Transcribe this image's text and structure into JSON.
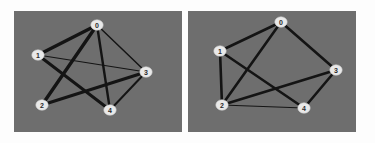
{
  "figure": {
    "background_color": "#fdfdfd",
    "panel_color": "#6e6e6e",
    "edge_color": "#141414",
    "node_fill_color": "#e9e9e9",
    "node_label_color": "#2b2b2b",
    "width": 375,
    "height": 143
  },
  "chart_data": {
    "type": "diagram",
    "subtype": "node-link-graph-pair",
    "title": "",
    "xlabel": "",
    "ylabel": "",
    "grid": false,
    "legend": null,
    "panels": [
      {
        "id": "panel-left",
        "name": "left-graph",
        "node_labels": [
          "0",
          "1",
          "2",
          "3",
          "4"
        ],
        "nodes": [
          {
            "id": "0",
            "label": "0",
            "x": 83,
            "y": 14
          },
          {
            "id": "1",
            "label": "1",
            "x": 24,
            "y": 44
          },
          {
            "id": "2",
            "label": "2",
            "x": 28,
            "y": 94
          },
          {
            "id": "3",
            "label": "3",
            "x": 132,
            "y": 61
          },
          {
            "id": "4",
            "label": "4",
            "x": 96,
            "y": 99
          }
        ],
        "edges": [
          {
            "source": "0",
            "target": "1",
            "weight": 3.4
          },
          {
            "source": "0",
            "target": "2",
            "weight": 3.4
          },
          {
            "source": "0",
            "target": "3",
            "weight": 1.5
          },
          {
            "source": "0",
            "target": "4",
            "weight": 2.4
          },
          {
            "source": "1",
            "target": "3",
            "weight": 1.2
          },
          {
            "source": "1",
            "target": "4",
            "weight": 3.0
          },
          {
            "source": "2",
            "target": "3",
            "weight": 3.0
          },
          {
            "source": "3",
            "target": "4",
            "weight": 2.0
          }
        ],
        "edge_count": 8,
        "node_count": 5
      },
      {
        "id": "panel-right",
        "name": "right-graph",
        "node_labels": [
          "0",
          "1",
          "2",
          "3",
          "4"
        ],
        "nodes": [
          {
            "id": "0",
            "label": "0",
            "x": 93,
            "y": 11
          },
          {
            "id": "1",
            "label": "1",
            "x": 32,
            "y": 40
          },
          {
            "id": "2",
            "label": "2",
            "x": 34,
            "y": 94
          },
          {
            "id": "3",
            "label": "3",
            "x": 148,
            "y": 59
          },
          {
            "id": "4",
            "label": "4",
            "x": 116,
            "y": 97
          }
        ],
        "edges": [
          {
            "source": "0",
            "target": "1",
            "weight": 2.6
          },
          {
            "source": "0",
            "target": "2",
            "weight": 2.6
          },
          {
            "source": "0",
            "target": "3",
            "weight": 2.6
          },
          {
            "source": "1",
            "target": "2",
            "weight": 2.6
          },
          {
            "source": "1",
            "target": "4",
            "weight": 2.6
          },
          {
            "source": "2",
            "target": "3",
            "weight": 2.6
          },
          {
            "source": "2",
            "target": "4",
            "weight": 1.2
          },
          {
            "source": "3",
            "target": "4",
            "weight": 2.6
          }
        ],
        "edge_count": 8,
        "node_count": 5
      }
    ]
  }
}
